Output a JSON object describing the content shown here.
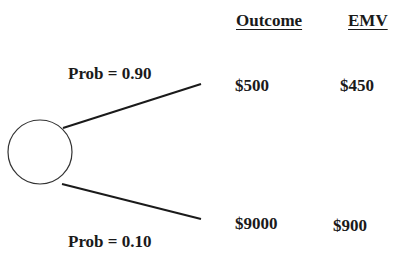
{
  "headers": {
    "outcome": "Outcome",
    "emv": "EMV"
  },
  "branches": [
    {
      "probability_label": "Prob = 0.90",
      "probability": 0.9,
      "outcome": "$500",
      "emv": "$450"
    },
    {
      "probability_label": "Prob = 0.10",
      "probability": 0.1,
      "outcome": "$9000",
      "emv": "$900"
    }
  ],
  "node": {
    "type": "chance-node"
  }
}
